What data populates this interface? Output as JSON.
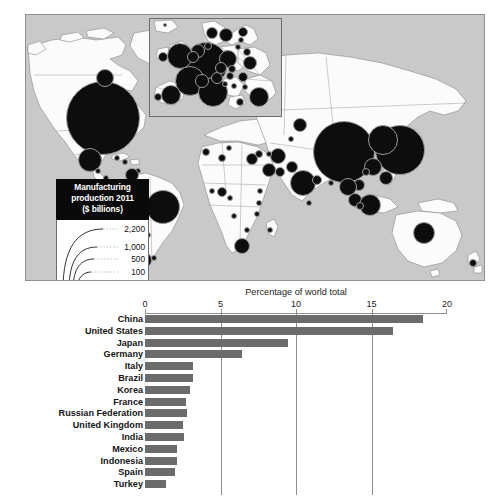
{
  "map": {
    "name": "world-map-manufacturing-production",
    "inset_region": "Europe",
    "legend": {
      "title_line1": "Manufacturing",
      "title_line2": "production 2011",
      "title_line3": "($ billions)",
      "scale_labels": [
        "2,200",
        "1,000",
        "500",
        "100",
        "1"
      ]
    },
    "bubbles": [
      {
        "label": "United States",
        "x": 77,
        "y": 103,
        "r": 37
      },
      {
        "label": "Canada",
        "x": 79,
        "y": 63,
        "r": 9
      },
      {
        "label": "Mexico",
        "x": 64,
        "y": 145,
        "r": 12
      },
      {
        "label": "Guatemala",
        "x": 72,
        "y": 156,
        "r": 3
      },
      {
        "label": "Cuba",
        "x": 91,
        "y": 143,
        "r": 3
      },
      {
        "label": "Dominican Republic",
        "x": 99,
        "y": 147,
        "r": 3
      },
      {
        "label": "Costa Rica",
        "x": 80,
        "y": 163,
        "r": 3
      },
      {
        "label": "Trinidad",
        "x": 112,
        "y": 156,
        "r": 3
      },
      {
        "label": "Venezuela",
        "x": 106,
        "y": 160,
        "r": 7
      },
      {
        "label": "Colombia",
        "x": 95,
        "y": 172,
        "r": 8
      },
      {
        "label": "Ecuador",
        "x": 88,
        "y": 181,
        "r": 4
      },
      {
        "label": "Peru",
        "x": 95,
        "y": 192,
        "r": 6
      },
      {
        "label": "Brazil",
        "x": 137,
        "y": 192,
        "r": 17
      },
      {
        "label": "Bolivia",
        "x": 108,
        "y": 205,
        "r": 3
      },
      {
        "label": "Paraguay",
        "x": 122,
        "y": 220,
        "r": 3
      },
      {
        "label": "Chile",
        "x": 104,
        "y": 233,
        "r": 7
      },
      {
        "label": "Argentina",
        "x": 117,
        "y": 245,
        "r": 9
      },
      {
        "label": "Uruguay",
        "x": 128,
        "y": 243,
        "r": 3
      },
      {
        "label": "Morocco",
        "x": 180,
        "y": 137,
        "r": 4
      },
      {
        "label": "Algeria",
        "x": 196,
        "y": 143,
        "r": 4
      },
      {
        "label": "Tunisia",
        "x": 203,
        "y": 133,
        "r": 3
      },
      {
        "label": "Egypt",
        "x": 226,
        "y": 144,
        "r": 6
      },
      {
        "label": "Nigeria",
        "x": 196,
        "y": 177,
        "r": 5
      },
      {
        "label": "Ghana",
        "x": 186,
        "y": 176,
        "r": 3
      },
      {
        "label": "Cameroon",
        "x": 204,
        "y": 183,
        "r": 3
      },
      {
        "label": "Ethiopia",
        "x": 234,
        "y": 176,
        "r": 3
      },
      {
        "label": "Kenya",
        "x": 233,
        "y": 188,
        "r": 3
      },
      {
        "label": "Tanzania",
        "x": 231,
        "y": 199,
        "r": 3
      },
      {
        "label": "Angola",
        "x": 208,
        "y": 201,
        "r": 3
      },
      {
        "label": "Zimbabwe",
        "x": 221,
        "y": 215,
        "r": 3
      },
      {
        "label": "South Africa",
        "x": 216,
        "y": 231,
        "r": 8
      },
      {
        "label": "Madagascar",
        "x": 244,
        "y": 215,
        "r": 3
      },
      {
        "label": "Saudi Arabia",
        "x": 243,
        "y": 155,
        "r": 7
      },
      {
        "label": "Israel",
        "x": 233,
        "y": 139,
        "r": 4
      },
      {
        "label": "UAE",
        "x": 254,
        "y": 157,
        "r": 5
      },
      {
        "label": "Iran",
        "x": 252,
        "y": 141,
        "r": 8
      },
      {
        "label": "Iraq",
        "x": 243,
        "y": 139,
        "r": 3
      },
      {
        "label": "Pakistan",
        "x": 266,
        "y": 152,
        "r": 6
      },
      {
        "label": "India",
        "x": 277,
        "y": 168,
        "r": 13
      },
      {
        "label": "Sri Lanka",
        "x": 283,
        "y": 188,
        "r": 3
      },
      {
        "label": "Bangladesh",
        "x": 291,
        "y": 165,
        "r": 5
      },
      {
        "label": "Kazakhstan",
        "x": 274,
        "y": 110,
        "r": 7
      },
      {
        "label": "Uzbekistan",
        "x": 265,
        "y": 124,
        "r": 3
      },
      {
        "label": "Russian Federation",
        "x": 242,
        "y": 65,
        "r": 14
      },
      {
        "label": "China",
        "x": 318,
        "y": 137,
        "r": 31
      },
      {
        "label": "Japan",
        "x": 374,
        "y": 135,
        "r": 25
      },
      {
        "label": "South Korea",
        "x": 357,
        "y": 125,
        "r": 15
      },
      {
        "label": "Taiwan",
        "x": 347,
        "y": 152,
        "r": 9
      },
      {
        "label": "Hong Kong",
        "x": 340,
        "y": 157,
        "r": 4
      },
      {
        "label": "Philippines",
        "x": 360,
        "y": 163,
        "r": 7
      },
      {
        "label": "Vietnam",
        "x": 333,
        "y": 170,
        "r": 6
      },
      {
        "label": "Thailand",
        "x": 322,
        "y": 172,
        "r": 9
      },
      {
        "label": "Malaysia",
        "x": 329,
        "y": 185,
        "r": 7
      },
      {
        "label": "Indonesia",
        "x": 344,
        "y": 190,
        "r": 11
      },
      {
        "label": "Singapore",
        "x": 334,
        "y": 191,
        "r": 4
      },
      {
        "label": "Myanmar",
        "x": 305,
        "y": 168,
        "r": 3
      },
      {
        "label": "Australia",
        "x": 398,
        "y": 218,
        "r": 11
      },
      {
        "label": "New Zealand",
        "x": 447,
        "y": 248,
        "r": 4
      }
    ],
    "inset_bubbles": [
      {
        "label": "Germany",
        "x": 56,
        "y": 45,
        "r": 22
      },
      {
        "label": "United Kingdom",
        "x": 30,
        "y": 37,
        "r": 13
      },
      {
        "label": "France",
        "x": 40,
        "y": 62,
        "r": 15
      },
      {
        "label": "Italy",
        "x": 63,
        "y": 73,
        "r": 15
      },
      {
        "label": "Spain",
        "x": 21,
        "y": 76,
        "r": 10
      },
      {
        "label": "Netherlands",
        "x": 48,
        "y": 32,
        "r": 7
      },
      {
        "label": "Belgium",
        "x": 43,
        "y": 38,
        "r": 6
      },
      {
        "label": "Switzerland",
        "x": 52,
        "y": 62,
        "r": 7
      },
      {
        "label": "Austria",
        "x": 67,
        "y": 59,
        "r": 6
      },
      {
        "label": "Poland",
        "x": 78,
        "y": 40,
        "r": 9
      },
      {
        "label": "Czech Republic",
        "x": 71,
        "y": 49,
        "r": 6
      },
      {
        "label": "Sweden",
        "x": 76,
        "y": 16,
        "r": 7
      },
      {
        "label": "Norway",
        "x": 62,
        "y": 14,
        "r": 6
      },
      {
        "label": "Denmark",
        "x": 58,
        "y": 27,
        "r": 4
      },
      {
        "label": "Finland",
        "x": 93,
        "y": 13,
        "r": 5
      },
      {
        "label": "Ireland",
        "x": 13,
        "y": 38,
        "r": 5
      },
      {
        "label": "Portugal",
        "x": 8,
        "y": 78,
        "r": 4
      },
      {
        "label": "Hungary",
        "x": 80,
        "y": 57,
        "r": 4
      },
      {
        "label": "Romania",
        "x": 93,
        "y": 58,
        "r": 5
      },
      {
        "label": "Slovakia",
        "x": 82,
        "y": 50,
        "r": 4
      },
      {
        "label": "Greece",
        "x": 90,
        "y": 83,
        "r": 4
      },
      {
        "label": "Turkey",
        "x": 109,
        "y": 78,
        "r": 10
      },
      {
        "label": "Ukraine",
        "x": 100,
        "y": 44,
        "r": 7
      },
      {
        "label": "Belarus",
        "x": 97,
        "y": 33,
        "r": 4
      },
      {
        "label": "Bulgaria",
        "x": 95,
        "y": 68,
        "r": 3
      },
      {
        "label": "Serbia",
        "x": 84,
        "y": 67,
        "r": 3
      },
      {
        "label": "Croatia",
        "x": 75,
        "y": 65,
        "r": 3
      },
      {
        "label": "Lithuania",
        "x": 88,
        "y": 28,
        "r": 3
      },
      {
        "label": "Estonia",
        "x": 91,
        "y": 21,
        "r": 3
      },
      {
        "label": "Iceland",
        "x": 15,
        "y": 6,
        "r": 2
      }
    ]
  },
  "chart_data": {
    "type": "bar",
    "title": "Percentage of world total",
    "xlabel": "",
    "ylabel": "",
    "orientation": "horizontal",
    "xlim": [
      0,
      20
    ],
    "xticks": [
      0,
      5,
      10,
      15,
      20
    ],
    "xtick_labels": [
      "0",
      "5",
      "10",
      "15",
      "20"
    ],
    "grid": true,
    "bar_color": "#6b6b6b",
    "categories": [
      "China",
      "United States",
      "Japan",
      "Germany",
      "Italy",
      "Brazil",
      "Korea",
      "France",
      "Russian Federation",
      "United Kingdom",
      "India",
      "Mexico",
      "Indonesia",
      "Spain",
      "Turkey"
    ],
    "values": [
      18.4,
      16.4,
      9.5,
      6.4,
      3.2,
      3.2,
      3.0,
      2.7,
      2.8,
      2.5,
      2.6,
      2.1,
      2.1,
      2.0,
      1.4
    ]
  }
}
